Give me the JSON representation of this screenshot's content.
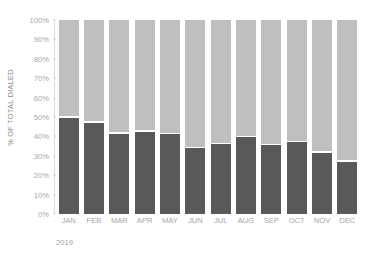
{
  "chart_data": {
    "type": "bar",
    "stacked": true,
    "stacked_normalized": true,
    "title": "",
    "subtitle": "",
    "xlabel": "2019",
    "ylabel": "% OF TOTAL DIALED",
    "categories": [
      "JAN",
      "FEB",
      "MAR",
      "APR",
      "MAY",
      "JUN",
      "JUL",
      "AUG",
      "SEP",
      "OCT",
      "NOV",
      "DEC"
    ],
    "series": [
      {
        "name": "dark-segment",
        "color": "#595959",
        "values": [
          49.5,
          47.0,
          41.5,
          42.5,
          41.0,
          34.0,
          36.0,
          39.5,
          35.5,
          37.0,
          31.5,
          27.0
        ]
      },
      {
        "name": "light-segment",
        "color": "#bfbfbf",
        "values": [
          50.5,
          53.0,
          58.5,
          57.5,
          59.0,
          66.0,
          64.0,
          60.5,
          64.5,
          63.0,
          68.5,
          73.0
        ]
      }
    ],
    "ylim": [
      0,
      100
    ],
    "ytick_labels": [
      "0%",
      "10%",
      "20%",
      "30%",
      "40%",
      "50%",
      "60%",
      "70%",
      "80%",
      "90%",
      "100%"
    ],
    "ytick_values": [
      0,
      10,
      20,
      30,
      40,
      50,
      60,
      70,
      80,
      90,
      100
    ],
    "grid": false,
    "legend": "none",
    "annotations": []
  },
  "axis": {
    "y_title": "% OF TOTAL DIALED",
    "x_group_label": "2019"
  },
  "colors": {
    "dark_segment": "#595959",
    "light_segment": "#bfbfbf",
    "tick_text": "#a6a6a6",
    "axis_line": "#d9d9d9",
    "background": "#ffffff"
  }
}
